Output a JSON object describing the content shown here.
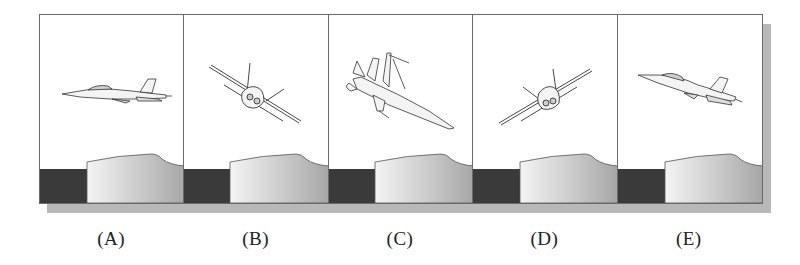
{
  "figure": {
    "colors": {
      "border": "#6a6a6a",
      "shadow": "#b8b8b8",
      "ground_dark": "#3a3a3a",
      "mound_light": "#f2f2f2",
      "mound_dark": "#a8a8a8",
      "aircraft_stroke": "#333333"
    },
    "panels": [
      {
        "label": "(A)",
        "attitude": "level-flight-side-view-facing-left"
      },
      {
        "label": "(B)",
        "attitude": "front-view-banked-left-wing-up"
      },
      {
        "label": "(C)",
        "attitude": "inverted-dive-nose-down-right"
      },
      {
        "label": "(D)",
        "attitude": "front-view-banked-right-wing-up"
      },
      {
        "label": "(E)",
        "attitude": "climbing-side-view-nose-up-left"
      }
    ]
  }
}
